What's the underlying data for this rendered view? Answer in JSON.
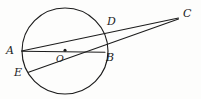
{
  "figure": {
    "kind": "geometry-diagram",
    "background_color": "#fdfdfc",
    "stroke_color": "#1c1c1c",
    "canvas": {
      "width": 201,
      "height": 99
    }
  },
  "circle": {
    "name": "main-circle",
    "center_x": 65,
    "center_y": 51,
    "radius": 43,
    "stroke_width": 1.2
  },
  "center_dot": {
    "cx": 65,
    "cy": 50,
    "r": 1.6
  },
  "points": [
    {
      "id": "A",
      "label": "A",
      "x": 22,
      "y": 51,
      "label_x": 7,
      "label_y": 45
    },
    {
      "id": "B",
      "label": "B",
      "x": 104,
      "y": 52,
      "label_x": 106,
      "label_y": 52
    },
    {
      "id": "C",
      "label": "C",
      "x": 178,
      "y": 18,
      "label_x": 183,
      "label_y": 8
    },
    {
      "id": "D",
      "label": "D",
      "x": 105,
      "y": 28,
      "label_x": 108,
      "label_y": 17
    },
    {
      "id": "E",
      "label": "E",
      "x": 29,
      "y": 71,
      "label_x": 15,
      "label_y": 68
    },
    {
      "id": "O",
      "label": "O",
      "x": 65,
      "y": 50,
      "label_x": 57,
      "label_y": 54
    }
  ],
  "segments": [
    {
      "id": "AB",
      "label": "A to B diameter",
      "x1": 22,
      "y1": 51,
      "x2": 105,
      "y2": 52
    },
    {
      "id": "ADC",
      "label": "A through D to C",
      "x1": 22,
      "y1": 51,
      "x2": 178,
      "y2": 18
    },
    {
      "id": "EBC",
      "label": "E through B to C",
      "x1": 29,
      "y1": 72,
      "x2": 178,
      "y2": 19
    }
  ],
  "labels": {
    "A": "A",
    "B": "B",
    "C": "C",
    "D": "D",
    "E": "E",
    "O": "O"
  }
}
